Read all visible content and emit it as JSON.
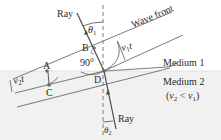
{
  "diagram": {
    "labels": {
      "ray_incident": "Ray",
      "ray_refracted": "Ray",
      "wave_front": "Wave front",
      "theta1": "θ",
      "theta1_sub": "1",
      "theta2": "θ",
      "theta2_sub": "2",
      "point_a": "A",
      "point_b": "B",
      "point_c": "C",
      "point_d": "D",
      "right_angle": "90°",
      "v1t": "v",
      "v1t_sub": "1",
      "v1t_t": "t",
      "v2t": "v",
      "v2t_sub": "2",
      "v2t_t": "t",
      "medium1": "Medium 1",
      "medium2": "Medium 2",
      "condition_open": "(",
      "condition_v2": "v",
      "condition_v2_sub": "2",
      "condition_lt": " < ",
      "condition_v1": "v",
      "condition_v1_sub": "1",
      "condition_close": ")"
    },
    "colors": {
      "line": "#6e6e6e",
      "ray": "#4a4a4a",
      "medium2_fill": "#f1f1f1",
      "text": "#2a2a2a"
    }
  }
}
